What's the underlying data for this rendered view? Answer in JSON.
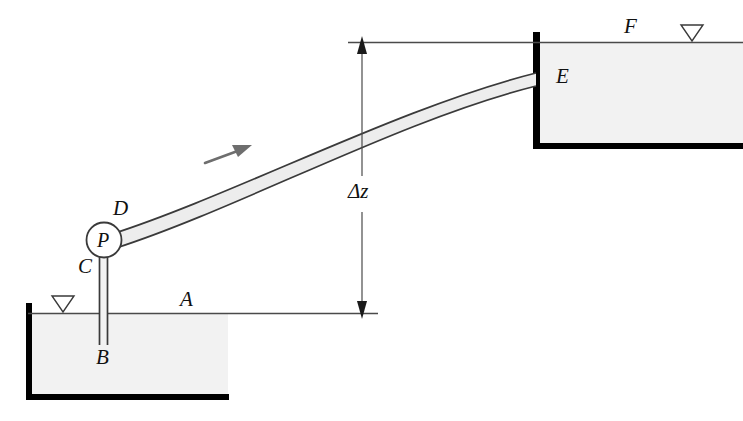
{
  "figure": {
    "colors": {
      "line": "#3a3a3a",
      "wall": "#000000",
      "fluid_fill": "#f2f2f2",
      "pipe_fill": "#ededed",
      "flow_arrow": "#6e6e6e",
      "background": "#ffffff"
    },
    "labels": {
      "point_a": "A",
      "point_b": "B",
      "point_c": "C",
      "point_d": "D",
      "point_e": "E",
      "point_f": "F",
      "pump": "P",
      "elevation_change": "Δz"
    },
    "annotations": {
      "flow_arrow_name": "flow-direction-arrow",
      "free_surface_symbol": "free-surface-triangle",
      "dimension_name": "elevation-dimension"
    }
  }
}
